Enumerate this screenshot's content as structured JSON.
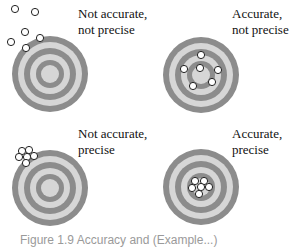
{
  "panels": [
    {
      "id": "tl",
      "label_line1": "Not accurate,",
      "label_line2": "not precise",
      "center": [
        50,
        74
      ],
      "dots": [
        [
          15,
          9
        ],
        [
          35,
          12
        ],
        [
          25,
          32
        ],
        [
          11,
          42
        ],
        [
          40,
          38
        ],
        [
          26,
          48
        ]
      ]
    },
    {
      "id": "tr",
      "label_line1": "Accurate,",
      "label_line2": "not precise",
      "center": [
        201,
        75
      ],
      "dots": [
        [
          201,
          55
        ],
        [
          184,
          69
        ],
        [
          200,
          68
        ],
        [
          218,
          70
        ],
        [
          212,
          82
        ],
        [
          193,
          86
        ]
      ]
    },
    {
      "id": "bl",
      "label_line1": "Not accurate,",
      "label_line2": "precise",
      "center": [
        50,
        188
      ],
      "dots": [
        [
          22,
          151
        ],
        [
          29,
          150
        ],
        [
          19,
          157
        ],
        [
          27,
          157
        ],
        [
          34,
          156
        ],
        [
          26,
          163
        ]
      ]
    },
    {
      "id": "br",
      "label_line1": "Accurate,",
      "label_line2": "precise",
      "center": [
        201,
        187
      ],
      "dots": [
        [
          195,
          181
        ],
        [
          204,
          181
        ],
        [
          192,
          188
        ],
        [
          201,
          187
        ],
        [
          209,
          187
        ],
        [
          199,
          194
        ]
      ]
    }
  ],
  "colors": {
    "dark": "#8c8c8c",
    "light": "#d6d6d6",
    "dot_fill": "#ffffff",
    "dot_stroke": "#222222"
  },
  "caption": "Figure 1.9  Accuracy and (Example...)"
}
